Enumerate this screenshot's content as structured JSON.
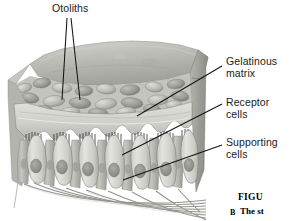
{
  "figure": {
    "background_color": "#ffffff",
    "style": "grayscale anatomical illustration",
    "width": 289,
    "height": 221
  },
  "labels": [
    {
      "id": "otoliths",
      "text": "Otoliths",
      "x": 52,
      "y": 4,
      "leader": "two vertical lines down into otolith layer"
    },
    {
      "id": "gelatinous-matrix",
      "line1": "Gelatinous",
      "line2": "matrix",
      "x": 226,
      "y": 58,
      "leader": "diagonal down-left to matrix layer"
    },
    {
      "id": "receptor-cells",
      "line1": "Receptor",
      "line2": "cells",
      "x": 226,
      "y": 99,
      "leader": "diagonal down-left to receptor cell body"
    },
    {
      "id": "supporting-cells",
      "line1": "Supporting",
      "line2": "cells",
      "x": 226,
      "y": 139,
      "leader": "diagonal down-left to supporting cell body"
    }
  ],
  "caption": {
    "figure_word": "FIGU",
    "panel_letter": "B",
    "body": "The st",
    "note": "text clipped at right edge of image"
  },
  "colors": {
    "label_text": "#1a1a1a",
    "leader_line": "#111111",
    "background": "#ffffff",
    "matrix_light": "#d9d9d7",
    "matrix_mid": "#b2b2ae",
    "matrix_dark": "#7e7e7a",
    "otolith_light": "#cfcfcb",
    "otolith_dark": "#8b8b86",
    "cell_light": "#dcdcd8",
    "cell_mid": "#b8b8b3",
    "nucleus": "#939390",
    "hair_dark": "#2f2f2d",
    "side_face": "#a9a9a4",
    "nerve": "#9a9a96"
  }
}
